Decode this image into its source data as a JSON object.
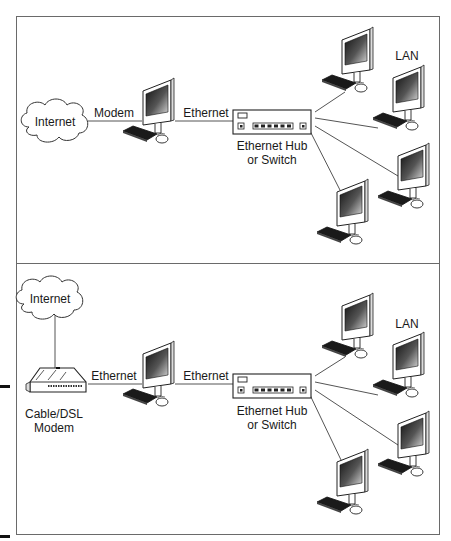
{
  "figure": {
    "panels": [
      {
        "id": "dialup",
        "internet_label": "Internet",
        "link1_label": "Modem",
        "link2_label": "Ethernet",
        "hub_label_line1": "Ethernet Hub",
        "hub_label_line2": "or Switch",
        "lan_label": "LAN"
      },
      {
        "id": "broadband",
        "internet_label": "Internet",
        "modem_label_line1": "Cable/DSL",
        "modem_label_line2": "Modem",
        "link1_label": "Ethernet",
        "link2_label": "Ethernet",
        "hub_label_line1": "Ethernet Hub",
        "hub_label_line2": "or Switch",
        "lan_label": "LAN"
      }
    ],
    "colors": {
      "frame": "#6a6a6a",
      "line": "#555555",
      "text": "#1a1a1a",
      "screen_dark": "#222222",
      "screen_light": "#c8c8c8"
    }
  }
}
